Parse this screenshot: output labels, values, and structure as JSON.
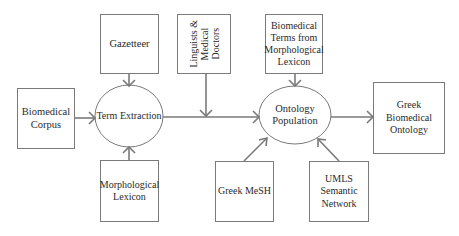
{
  "diagram": {
    "type": "flowchart",
    "nodes": {
      "gazetteer": {
        "label": "Gazetteer",
        "shape": "rectangle"
      },
      "linguists": {
        "label": "Linguists &\nMedical\nDoctors",
        "shape": "rectangle",
        "text_orientation": "vertical"
      },
      "biomedical_terms": {
        "label": "Biomedical\nTerms from\nMorphological\nLexicon",
        "shape": "rectangle"
      },
      "biomedical_corpus": {
        "label": "Biomedical\nCorpus",
        "shape": "rectangle"
      },
      "term_extraction": {
        "label": "Term Extraction",
        "shape": "ellipse"
      },
      "ontology_population": {
        "label": "Ontology\nPopulation",
        "shape": "ellipse"
      },
      "greek_biomedical_ontology": {
        "label": "Greek Biomedical\nOntology",
        "shape": "rectangle"
      },
      "morphological_lexicon": {
        "label": "Morphological\nLexicon",
        "shape": "rectangle"
      },
      "greek_mesh": {
        "label": "Greek MeSH",
        "shape": "rectangle"
      },
      "umls": {
        "label": "UMLS\nSemantic\nNetwork",
        "shape": "rectangle"
      }
    },
    "edges": [
      {
        "from": "gazetteer",
        "to": "term_extraction"
      },
      {
        "from": "biomedical_corpus",
        "to": "term_extraction"
      },
      {
        "from": "morphological_lexicon",
        "to": "term_extraction"
      },
      {
        "from": "term_extraction",
        "to": "ontology_population"
      },
      {
        "from": "linguists",
        "to": "term_extraction_to_ontology_population_edge"
      },
      {
        "from": "biomedical_terms",
        "to": "ontology_population"
      },
      {
        "from": "greek_mesh",
        "to": "ontology_population"
      },
      {
        "from": "umls",
        "to": "ontology_population"
      },
      {
        "from": "ontology_population",
        "to": "greek_biomedical_ontology"
      }
    ],
    "colors": {
      "stroke": "#7a7a7a",
      "text": "#2a2a2a",
      "background": "#ffffff"
    }
  }
}
